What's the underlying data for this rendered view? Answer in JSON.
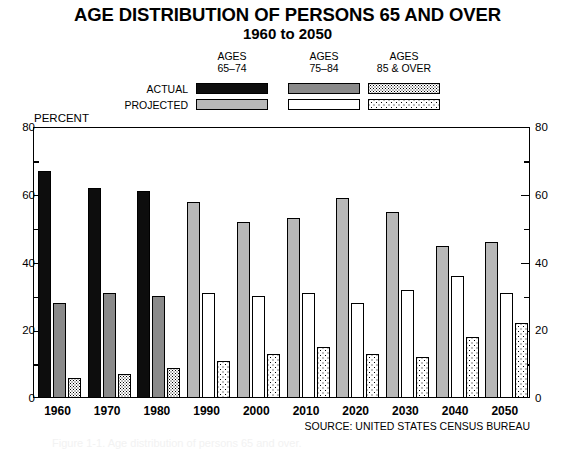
{
  "title": {
    "main": "AGE DISTRIBUTION OF PERSONS 65 AND OVER",
    "sub": "1960 to 2050"
  },
  "legend": {
    "columns": [
      {
        "line1": "AGES",
        "line2": "65–74",
        "actual_swatch": "solid-black",
        "projected_swatch": "solid-light-gray"
      },
      {
        "line1": "AGES",
        "line2": "75–84",
        "actual_swatch": "solid-medium-gray",
        "projected_swatch": "solid-white"
      },
      {
        "line1": "AGES",
        "line2": "85 & OVER",
        "actual_swatch": "dense-dotted",
        "projected_swatch": "sparse-dotted"
      }
    ],
    "rows": [
      {
        "label": "ACTUAL"
      },
      {
        "label": "PROJECTED"
      }
    ]
  },
  "axis": {
    "y_title": "PERCENT",
    "y_ticks_major": [
      "0",
      "20",
      "40",
      "60",
      "80"
    ],
    "y_ticks_minor": [
      "10",
      "30",
      "50",
      "70"
    ],
    "y_min": 0,
    "y_max": 80
  },
  "source": "SOURCE:  UNITED STATES CENSUS BUREAU",
  "caption_faint": "Figure 1-1. Age distribution of persons 65 and over.",
  "chart_data": {
    "type": "bar",
    "title": "AGE DISTRIBUTION OF PERSONS 65 AND OVER 1960 to 2050",
    "xlabel": "",
    "ylabel": "PERCENT",
    "ylim": [
      0,
      80
    ],
    "grid": false,
    "legend_position": "top",
    "categories": [
      "1960",
      "1970",
      "1980",
      "1990",
      "2000",
      "2010",
      "2020",
      "2030",
      "2040",
      "2050"
    ],
    "status": [
      "actual",
      "actual",
      "actual",
      "projected",
      "projected",
      "projected",
      "projected",
      "projected",
      "projected",
      "projected"
    ],
    "series": [
      {
        "name": "AGES 65–74",
        "values": [
          67,
          62,
          61,
          58,
          52,
          53,
          59,
          55,
          45,
          46
        ]
      },
      {
        "name": "AGES 75–84",
        "values": [
          28,
          31,
          30,
          31,
          30,
          31,
          28,
          32,
          36,
          31
        ]
      },
      {
        "name": "AGES 85 & OVER",
        "values": [
          6,
          7,
          9,
          11,
          13,
          15,
          13,
          12,
          18,
          22
        ]
      }
    ]
  }
}
